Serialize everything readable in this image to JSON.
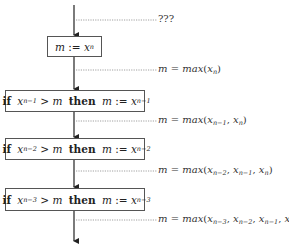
{
  "diagram": {
    "type": "flowchart",
    "top_annotation": "???",
    "steps": [
      {
        "kind": "assign",
        "text": "m := x_n",
        "var": "m",
        "op": ":=",
        "target": "x",
        "target_sub": "n",
        "annotation": {
          "lhs": "m",
          "eq": "=",
          "fn": "max",
          "args": [
            "x_n"
          ]
        }
      },
      {
        "kind": "if",
        "if_kw": "if",
        "cond_var": "x",
        "cond_sub": "n−1",
        "cmp": ">",
        "cmp_rhs": "m",
        "then_kw": "then",
        "assign_var": "m",
        "op": ":=",
        "assign_target": "x",
        "assign_sub": "n−1",
        "annotation": {
          "lhs": "m",
          "eq": "=",
          "fn": "max",
          "args": [
            "x_{n−1}",
            "x_n"
          ]
        }
      },
      {
        "kind": "if",
        "if_kw": "if",
        "cond_var": "x",
        "cond_sub": "n−2",
        "cmp": ">",
        "cmp_rhs": "m",
        "then_kw": "then",
        "assign_var": "m",
        "op": ":=",
        "assign_target": "x",
        "assign_sub": "n−2",
        "annotation": {
          "lhs": "m",
          "eq": "=",
          "fn": "max",
          "args": [
            "x_{n−2}",
            "x_{n−1}",
            "x_n"
          ]
        }
      },
      {
        "kind": "if",
        "if_kw": "if",
        "cond_var": "x",
        "cond_sub": "n−3",
        "cmp": ">",
        "cmp_rhs": "m",
        "then_kw": "then",
        "assign_var": "m",
        "op": ":=",
        "assign_target": "x",
        "assign_sub": "n−3",
        "annotation": {
          "lhs": "m",
          "eq": "=",
          "fn": "max",
          "args": [
            "x_{n−3}",
            "x_{n−2}",
            "x_{n−1}",
            "x_n"
          ]
        }
      }
    ]
  },
  "t": {
    "q": "???",
    "m": "m",
    "assign": ":=",
    "x": "x",
    "n": "n",
    "n1": "n−1",
    "n2": "n−2",
    "n3": "n−3",
    "if": "if",
    "then": "then",
    "gt": ">",
    "eq": "=",
    "max": "max",
    "lp": "(",
    "rp": ")",
    "comma": ", "
  }
}
